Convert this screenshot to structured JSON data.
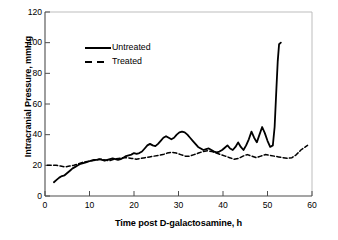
{
  "chart_data": {
    "type": "line",
    "title": "",
    "xlabel": "Time post D-galactosamine, h",
    "ylabel": "Intracranial Pressure, mmHg",
    "xlim": [
      0,
      60
    ],
    "ylim": [
      0,
      120
    ],
    "xticks": [
      0,
      10,
      20,
      30,
      40,
      50,
      60
    ],
    "yticks": [
      0,
      20,
      40,
      60,
      80,
      100,
      120
    ],
    "grid": false,
    "legend_position": "upper-left-inside",
    "series": [
      {
        "name": "Untreated",
        "style": "solid",
        "color": "#000000",
        "x": [
          2.0,
          2.6,
          3.2,
          3.8,
          4.4,
          5.0,
          5.6,
          6.2,
          6.8,
          7.4,
          8.0,
          8.6,
          9.2,
          9.8,
          10.4,
          11.0,
          11.6,
          12.2,
          12.8,
          13.4,
          14.0,
          14.6,
          15.2,
          15.8,
          16.4,
          17.0,
          17.6,
          18.2,
          18.8,
          19.4,
          20.0,
          20.6,
          21.2,
          21.8,
          22.4,
          23.0,
          23.6,
          24.2,
          24.8,
          25.4,
          26.0,
          26.6,
          27.2,
          27.8,
          28.4,
          29.0,
          29.6,
          30.2,
          30.8,
          31.4,
          32.0,
          32.6,
          33.2,
          33.8,
          34.4,
          35.0,
          35.6,
          36.2,
          36.8,
          37.4,
          38.0,
          38.6,
          39.2,
          39.8,
          40.4,
          41.0,
          41.6,
          42.2,
          42.8,
          43.4,
          44.0,
          44.6,
          45.2,
          45.8,
          46.4,
          47.0,
          47.6,
          48.2,
          48.8,
          49.4,
          50.0,
          50.6,
          51.2,
          51.6,
          52.0,
          52.3,
          52.6,
          53.0
        ],
        "y": [
          9,
          10.5,
          12,
          13,
          13.5,
          15,
          16.5,
          18,
          19,
          20,
          21,
          21.5,
          22,
          22.5,
          23,
          23.5,
          23.5,
          24,
          23.5,
          23,
          23.5,
          24,
          24.5,
          24,
          23.5,
          24,
          25,
          26,
          26.5,
          27,
          28,
          27.5,
          28,
          29,
          31,
          33,
          34,
          33,
          32.5,
          34,
          36,
          38,
          39,
          38,
          37,
          38,
          40,
          41.5,
          42,
          41.5,
          40,
          38,
          36,
          34,
          32,
          31,
          30,
          30.5,
          31,
          30,
          29,
          28.5,
          29,
          30,
          31.5,
          33,
          31,
          30,
          32,
          35,
          32,
          30,
          33,
          37,
          42,
          38,
          35,
          40,
          45,
          41,
          36,
          32,
          33,
          45,
          70,
          88,
          99,
          100
        ],
        "end_note": "terminal spike to 100 mmHg"
      },
      {
        "name": "Treated",
        "style": "dashed",
        "color": "#000000",
        "x": [
          0.5,
          1.5,
          2.5,
          3.5,
          4.5,
          5.5,
          6.5,
          7.5,
          8.5,
          9.5,
          10.5,
          11.5,
          12.5,
          13.5,
          14.5,
          15.5,
          16.5,
          17.5,
          18.5,
          19.5,
          20.5,
          21.5,
          22.5,
          23.5,
          24.5,
          25.5,
          26.5,
          27.5,
          28.5,
          29.5,
          30.5,
          31.5,
          32.5,
          33.5,
          34.5,
          35.5,
          36.5,
          37.5,
          38.5,
          39.5,
          40.5,
          41.5,
          42.5,
          43.5,
          44.5,
          45.5,
          46.5,
          47.5,
          48.5,
          49.5,
          50.5,
          51.5,
          52.5,
          53.5,
          54.5,
          55.5,
          56.5,
          57.5,
          58.5,
          59.0
        ],
        "y": [
          20,
          20,
          20,
          19.5,
          19,
          19.5,
          20,
          21,
          22,
          22.5,
          23,
          23.5,
          24,
          23.5,
          23,
          24,
          24.5,
          25,
          25,
          24.5,
          24,
          24.5,
          25,
          25.5,
          26,
          26.5,
          27,
          28,
          28.5,
          28,
          27,
          26,
          26,
          27,
          28,
          29,
          29.5,
          29,
          28,
          27,
          26,
          25,
          24,
          24.5,
          26,
          27,
          26,
          25,
          26,
          27,
          26.5,
          26,
          25.5,
          25,
          24.5,
          25,
          27,
          30,
          32,
          33
        ]
      }
    ]
  },
  "legend": {
    "items": [
      {
        "label": "Untreated",
        "style": "solid"
      },
      {
        "label": "Treated",
        "style": "dashed"
      }
    ]
  }
}
